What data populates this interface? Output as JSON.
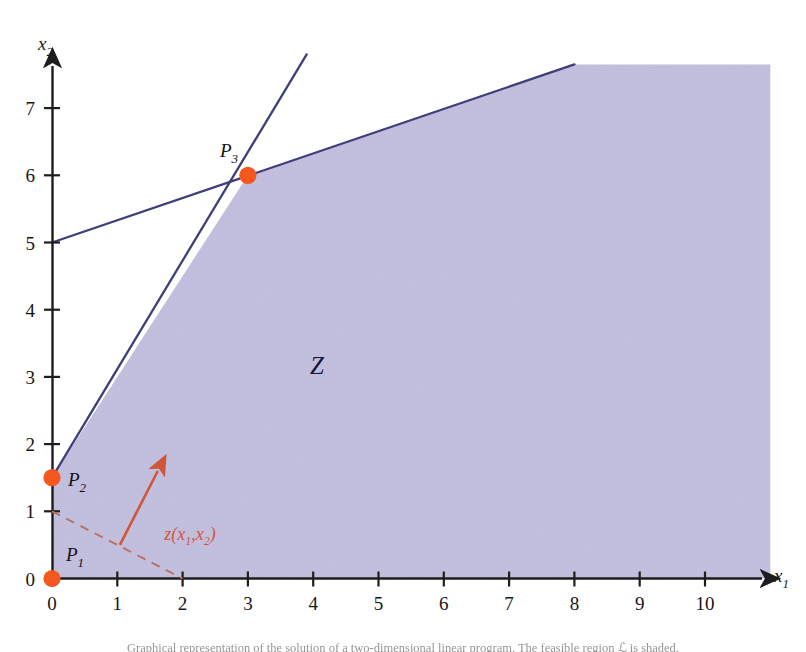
{
  "figure": {
    "region_label": "ℒ",
    "region_label_display": "Z",
    "background_color": "#ffffff",
    "region_fill_color": "#c3c0e0",
    "line_color": "#3f3f7a",
    "point_color": "#f4581f",
    "gradient_color": "#cf5638",
    "axis_color": "#1d1d1d"
  },
  "axes": {
    "x": {
      "label": "x",
      "label_sub": "1",
      "ticks": [
        "0",
        "1",
        "2",
        "3",
        "4",
        "5",
        "6",
        "7",
        "8",
        "9",
        "10"
      ],
      "min": 0,
      "max": 10,
      "arrow": true
    },
    "y": {
      "label": "x",
      "label_sub": "2",
      "ticks": [
        "0",
        "1",
        "2",
        "3",
        "4",
        "5",
        "6",
        "7"
      ],
      "min": 0,
      "max": 7,
      "arrow": true
    }
  },
  "points": [
    {
      "name": "P1",
      "label": "P",
      "label_sub": "1",
      "x": 0,
      "y": 0,
      "label_dx": 14,
      "label_dy": -18
    },
    {
      "name": "P2",
      "label": "P",
      "label_sub": "2",
      "x": 0,
      "y": 1.5,
      "label_dx": 16,
      "label_dy": 8
    },
    {
      "name": "P3",
      "label": "P",
      "label_sub": "3",
      "x": 3,
      "y": 6,
      "label_dx": -28,
      "label_dy": -18
    }
  ],
  "constraint_lines": [
    {
      "name": "steep-constraint-line",
      "from": {
        "x": 0,
        "y": 1.5
      },
      "to": {
        "x": 3.9,
        "y": 7.8
      },
      "slope": 1.5,
      "intercept": 1.5
    },
    {
      "name": "shallow-constraint-line",
      "from": {
        "x": 0,
        "y": 5
      },
      "to": {
        "x": 8,
        "y": 7.65
      },
      "slope": 0.3333,
      "intercept": 5
    }
  ],
  "feasible_region": {
    "name": "feasible-region-Z",
    "vertices": [
      {
        "x": 0,
        "y": 1.5
      },
      {
        "x": 3,
        "y": 6
      },
      {
        "x": 8,
        "y": 7.65
      },
      {
        "x": 11,
        "y": 7.65
      },
      {
        "x": 11,
        "y": 0
      },
      {
        "x": 0,
        "y": 0
      }
    ],
    "label_position": {
      "x": 3.95,
      "y": 3.05
    }
  },
  "gradient": {
    "name": "objective-gradient",
    "label": "z(x",
    "label_sub1": "1",
    "label_mid": ",x",
    "label_sub2": "2",
    "label_end": ")",
    "label_full": "z(x1,x2)",
    "arrow_from": {
      "x": 1.04,
      "y": 0.5
    },
    "arrow_to": {
      "x": 1.62,
      "y": 1.6
    },
    "level_line_from": {
      "x": 0,
      "y": 1
    },
    "level_line_to": {
      "x": 2,
      "y": 0
    },
    "level_line_style": "dashed",
    "label_position": {
      "x": 1.72,
      "y": 0.58
    }
  },
  "caption": {
    "text": "Graphical representation of the solution of a two-dimensional linear program. The feasible region ℒ is shaded."
  }
}
